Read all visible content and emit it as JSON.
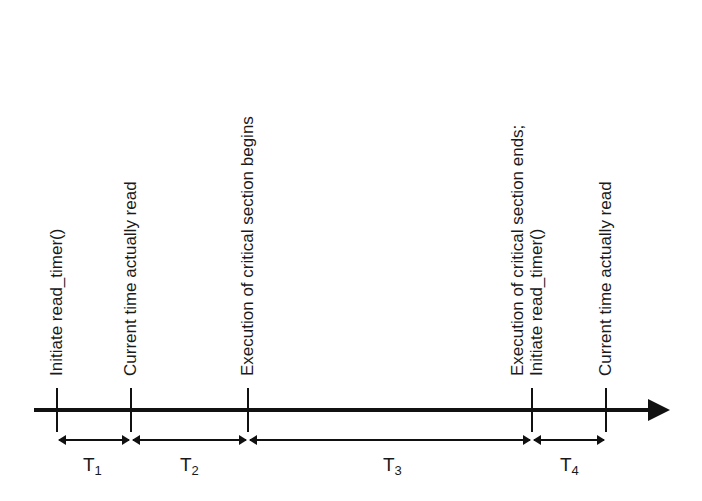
{
  "diagram": {
    "type": "timeline",
    "events": [
      {
        "x": 57,
        "label": "Initiate read_timer()"
      },
      {
        "x": 131,
        "label": "Current time actually read"
      },
      {
        "x": 248,
        "label": "Execution of critical section begins"
      },
      {
        "x": 532,
        "label_line1": "Execution of critical section ends;",
        "label_line2": "Initiate read_timer()"
      },
      {
        "x": 606,
        "label": "Current time actually read"
      }
    ],
    "intervals": [
      {
        "name": "T",
        "sub": "1",
        "from": 57,
        "to": 131
      },
      {
        "name": "T",
        "sub": "2",
        "from": 131,
        "to": 248
      },
      {
        "name": "T",
        "sub": "3",
        "from": 248,
        "to": 532
      },
      {
        "name": "T",
        "sub": "4",
        "from": 532,
        "to": 606
      }
    ]
  }
}
